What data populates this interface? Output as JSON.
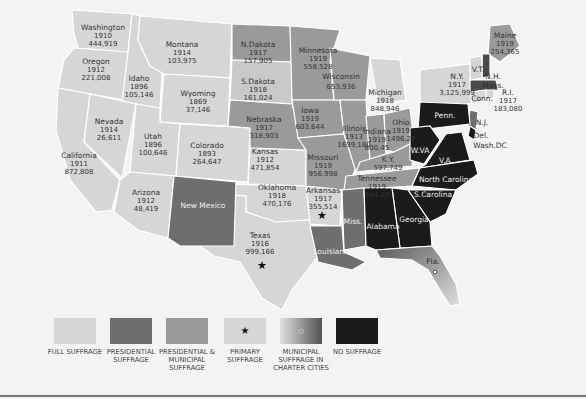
{
  "colors": {
    "full": "#d6d6d6",
    "presidential": "#6e6e6e",
    "pres_municipal": "#9a9a9a",
    "primary": "#d6d6d6",
    "municipal_charter": "#7a7a7a",
    "none": "#1b1b1b",
    "background": "#f3f3f3"
  },
  "states": [
    {
      "name": "Washington",
      "year": "1910",
      "votes": "444,919"
    },
    {
      "name": "Oregon",
      "year": "1912",
      "votes": "221,008"
    },
    {
      "name": "California",
      "year": "1911",
      "votes": "872,808"
    },
    {
      "name": "Idaho",
      "year": "1896",
      "votes": "105,146"
    },
    {
      "name": "Nevada",
      "year": "1914",
      "votes": "26,611"
    },
    {
      "name": "Montana",
      "year": "1914",
      "votes": "103,975"
    },
    {
      "name": "Wyoming",
      "year": "1869",
      "votes": "37,146"
    },
    {
      "name": "Utah",
      "year": "1896",
      "votes": "100,646"
    },
    {
      "name": "Colorado",
      "year": "1893",
      "votes": "264,647"
    },
    {
      "name": "Arizona",
      "year": "1912",
      "votes": "48,419"
    },
    {
      "name": "New Mexico",
      "year": "",
      "votes": ""
    },
    {
      "name": "N.Dakota",
      "year": "1917",
      "votes": "157,905"
    },
    {
      "name": "S.Dakota",
      "year": "1918",
      "votes": "161,024"
    },
    {
      "name": "Nebraska",
      "year": "1917",
      "votes": "318,903"
    },
    {
      "name": "Kansas",
      "year": "1912",
      "votes": "471,854"
    },
    {
      "name": "Oklahoma",
      "year": "1918",
      "votes": "470,176"
    },
    {
      "name": "Texas",
      "year": "1916",
      "votes": "999,166"
    },
    {
      "name": "Minnesota",
      "year": "1919",
      "votes": "558,528"
    },
    {
      "name": "Iowa",
      "year": "1919",
      "votes": "603,644"
    },
    {
      "name": "Missouri",
      "year": "1919",
      "votes": "956,998"
    },
    {
      "name": "Arkansas",
      "year": "1917",
      "votes": "355,514"
    },
    {
      "name": "Louisiana",
      "year": "",
      "votes": ""
    },
    {
      "name": "Wisconsin",
      "year": "",
      "votes": "653,936"
    },
    {
      "name": "Illinois",
      "year": "1913",
      "votes": "1699,180"
    },
    {
      "name": "Michigan",
      "year": "1918",
      "votes": "848,946"
    },
    {
      "name": "Indiana",
      "year": "1919",
      "votes": "800,45"
    },
    {
      "name": "Ohio",
      "year": "1919",
      "votes": "1496,22"
    },
    {
      "name": "K.Y.",
      "year": "",
      "votes": "597,749"
    },
    {
      "name": "Tennessee",
      "year": "1919",
      "votes": "564,10"
    },
    {
      "name": "Miss.",
      "year": "",
      "votes": ""
    },
    {
      "name": "Alabama",
      "year": "",
      "votes": ""
    },
    {
      "name": "Georgia",
      "year": "",
      "votes": ""
    },
    {
      "name": "Fla.",
      "year": "",
      "votes": ""
    },
    {
      "name": "S.Carolina",
      "year": "",
      "votes": ""
    },
    {
      "name": "North Carolina",
      "year": "",
      "votes": ""
    },
    {
      "name": "V.A.",
      "year": "",
      "votes": ""
    },
    {
      "name": "W.VA",
      "year": "",
      "votes": ""
    },
    {
      "name": "Penn.",
      "year": "",
      "votes": ""
    },
    {
      "name": "N.Y.",
      "year": "1917",
      "votes": "3,125,999"
    },
    {
      "name": "V.T.",
      "year": "",
      "votes": ""
    },
    {
      "name": "N.H.",
      "year": "",
      "votes": ""
    },
    {
      "name": "Maine",
      "year": "1919",
      "votes": "254,365"
    },
    {
      "name": "Mass.",
      "year": "",
      "votes": ""
    },
    {
      "name": "Conn.",
      "year": "",
      "votes": ""
    },
    {
      "name": "R.I.",
      "year": "1917",
      "votes": "183,080"
    },
    {
      "name": "N.J.",
      "year": "",
      "votes": ""
    },
    {
      "name": "Del.",
      "year": "",
      "votes": ""
    },
    {
      "name": "Wash.DC",
      "year": "",
      "votes": ""
    }
  ],
  "legend": [
    {
      "label": "FULL SUFFRAGE",
      "key": "full"
    },
    {
      "label": "PRESIDENTIAL SUFFRAGE",
      "key": "presidential"
    },
    {
      "label": "PRESIDENTIAL & MUNICIPAL SUFFRAGE",
      "key": "pres_municipal"
    },
    {
      "label": "PRIMARY SUFFRAGE",
      "key": "primary",
      "marker": "★"
    },
    {
      "label": "MUNICIPAL SUFFRAGE IN CHARTER CITIES",
      "key": "municipal_charter",
      "marker": "○"
    },
    {
      "label": "NO SUFFRAGE",
      "key": "none"
    }
  ]
}
